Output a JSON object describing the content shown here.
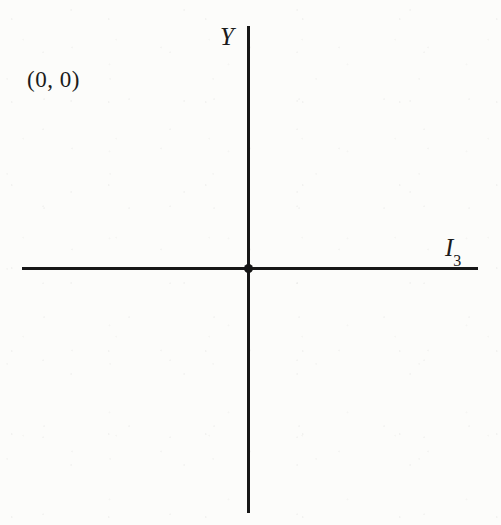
{
  "figure": {
    "background_color": "#fcfcfa",
    "line_color": "#171717",
    "text_color": "#1b1b1b"
  },
  "labels": {
    "y_axis": "Y",
    "x_axis_base": "I",
    "x_axis_subscript": "3",
    "origin_point": "(0, 0)"
  },
  "chart_data": {
    "type": "scatter",
    "title": "",
    "xlabel": "I3",
    "ylabel": "Y",
    "grid": false,
    "legend": null,
    "annotations": [
      {
        "text": "(0, 0)",
        "describes": "origin-point",
        "x": 0,
        "y": 0
      }
    ],
    "points": [
      {
        "x": 0,
        "y": 0,
        "label": "(0, 0)",
        "marker": "filled-circle"
      }
    ],
    "xlim": [
      -1,
      1
    ],
    "ylim": [
      -1,
      1
    ],
    "xticks": [],
    "yticks": []
  }
}
